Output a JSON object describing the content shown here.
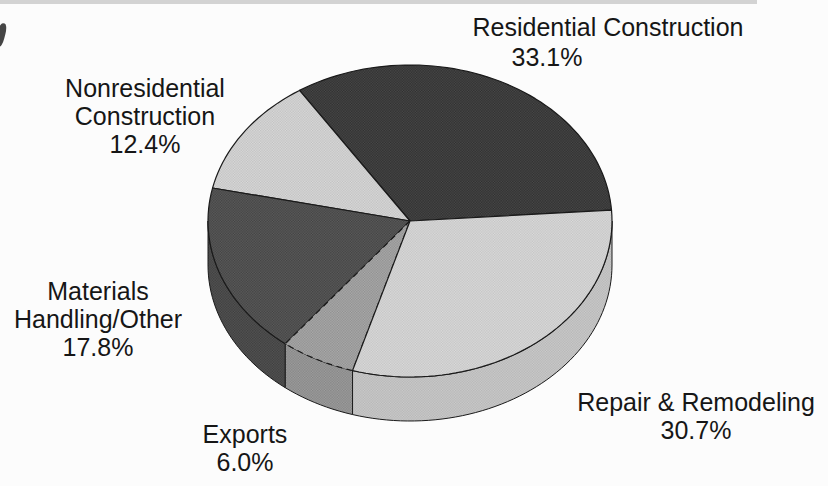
{
  "figure": {
    "background": "#fcfcfc",
    "title": ""
  },
  "chart_data": {
    "type": "pie",
    "style": "3d",
    "title": "",
    "legend": "none",
    "units": "%",
    "start_angle_deg": 4,
    "direction": "counterclockwise",
    "total": 100.0,
    "slices": [
      {
        "id": "residential",
        "label": "Residential Construction",
        "label_lines": [
          "Residential Construction"
        ],
        "value": 33.1,
        "value_label": "33.1%",
        "fill": "#2e2e2e",
        "dot": "#4a4a4a",
        "dashed_outline": false
      },
      {
        "id": "nonresidential",
        "label": "Nonresidential Construction",
        "label_lines": [
          "Nonresidential",
          "Construction"
        ],
        "value": 12.4,
        "value_label": "12.4%",
        "fill": "#dbdbdb",
        "dot": "#bfbfbf",
        "dashed_outline": false
      },
      {
        "id": "materials",
        "label": "Materials Handling/Other",
        "label_lines": [
          "Materials",
          "Handling/Other"
        ],
        "value": 17.8,
        "value_label": "17.8%",
        "fill": "#5d5d5d",
        "dot": "#414141",
        "dashed_outline": false
      },
      {
        "id": "exports",
        "label": "Exports",
        "label_lines": [
          "Exports"
        ],
        "value": 6.0,
        "value_label": "6.0%",
        "fill": "#acacac",
        "dot": "#8e8e8e",
        "dashed_outline": true
      },
      {
        "id": "repair",
        "label": "Repair & Remodeling",
        "label_lines": [
          "Repair & Remodeling"
        ],
        "value": 30.7,
        "value_label": "30.7%",
        "fill": "#dcdcdc",
        "dot": "#c3c3c3",
        "dashed_outline": false
      }
    ]
  }
}
